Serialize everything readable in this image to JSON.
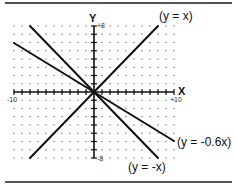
{
  "figure": {
    "axis_x_label": "X",
    "axis_y_label": "Y",
    "tick_x_min": "-10",
    "tick_x_max": "+10",
    "tick_y_max": "+8",
    "tick_y_min": "-8",
    "line_labels": {
      "y_eq_x": "(y = x)",
      "y_eq_neg_x": "(y = -x)",
      "y_eq_neg_0_6x": "(y = -0.6x)"
    },
    "colors": {
      "line": "#111111",
      "grid_dot": "#666666",
      "rule": "#555555"
    }
  },
  "chart_data": {
    "type": "line",
    "title": "",
    "xlabel": "X",
    "ylabel": "Y",
    "xlim": [
      -10,
      10
    ],
    "ylim": [
      -8,
      8
    ],
    "grid": "dotted",
    "series": [
      {
        "name": "(y = x)",
        "x": [
          -8,
          8
        ],
        "y": [
          -8,
          8
        ]
      },
      {
        "name": "(y = -x)",
        "x": [
          -8,
          8
        ],
        "y": [
          8,
          -8
        ]
      },
      {
        "name": "(y = -0.6x)",
        "x": [
          -10,
          10
        ],
        "y": [
          6,
          -6
        ]
      }
    ]
  }
}
